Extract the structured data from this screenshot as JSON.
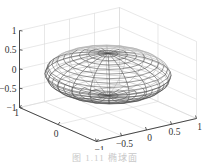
{
  "chart_data": {
    "type": "surface3d",
    "surface": "ellipsoid",
    "render": "mesh",
    "radii": {
      "x": 1,
      "y": 1,
      "z": 0.55
    },
    "mesh": {
      "meridians": 20,
      "parallels": 20
    },
    "axes": {
      "x": {
        "range": [
          -1,
          1
        ],
        "ticks": [
          1,
          0,
          -1
        ],
        "tick_labels": [
          "1",
          "0",
          "−1"
        ],
        "shown_labels": [
          "1",
          "0"
        ]
      },
      "y": {
        "range": [
          -1,
          1
        ],
        "ticks": [
          -1,
          -0.5,
          0,
          0.5,
          1
        ],
        "tick_labels": [
          "−1",
          "−0.5",
          "0",
          "0.5",
          "1"
        ]
      },
      "z": {
        "range": [
          -1,
          1
        ],
        "ticks": [
          1,
          0.5,
          0,
          -0.5,
          -1
        ],
        "tick_labels": [
          "1",
          "0.5",
          "0",
          "−0.5",
          "−1"
        ]
      }
    },
    "grid": true,
    "title": "",
    "colors": {
      "mesh": "#4a4a4a",
      "grid": "#d9d9d9",
      "axis": "#333333"
    }
  },
  "caption": "图 1.11    椭球面"
}
